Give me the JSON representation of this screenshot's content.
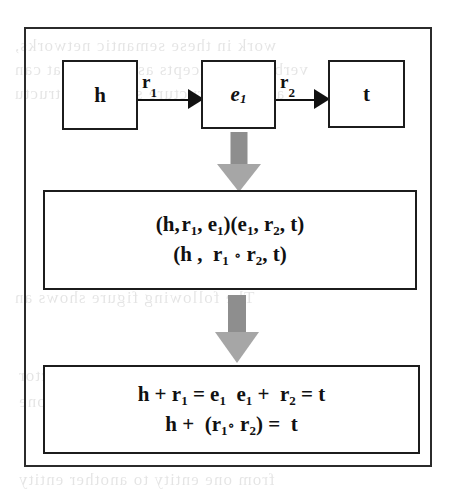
{
  "figure": {
    "name": "relation-path-composition-diagram",
    "frame_border_color": "#2b2b2b",
    "flow_arrow_shaft_color": "#8e8e8e",
    "flow_arrow_head_color": "#a6a6a6",
    "node_border_color": "#1c1c1c",
    "text_color": "#111111"
  },
  "graph": {
    "nodes": [
      {
        "id": "head",
        "label": "h",
        "sub": "",
        "italic": false
      },
      {
        "id": "entity",
        "label": "e",
        "sub": "1",
        "italic": true
      },
      {
        "id": "tail",
        "label": "t",
        "sub": "",
        "italic": false
      }
    ],
    "edges": [
      {
        "id": "edge-r1",
        "label": "r",
        "sub": "1",
        "from": "head",
        "to": "entity"
      },
      {
        "id": "edge-r2",
        "label": "r",
        "sub": "2",
        "from": "entity",
        "to": "tail"
      }
    ]
  },
  "flow_arrows": [
    {
      "id": "flow-arrow-1",
      "direction": "down"
    },
    {
      "id": "flow-arrow-2",
      "direction": "down"
    }
  ],
  "composition_box": {
    "line1_parts": [
      {
        "t": "(h, r"
      },
      {
        "sub": "1"
      },
      {
        "t": ", e"
      },
      {
        "sub": "1"
      },
      {
        "t": ")(e"
      },
      {
        "sub": "1"
      },
      {
        "t": ", r"
      },
      {
        "sub": "2"
      },
      {
        "t": ", t)"
      }
    ],
    "line2_parts": [
      {
        "t": "(h ,  r"
      },
      {
        "sub": "1"
      },
      {
        "ring": " ∘ "
      },
      {
        "t": "r"
      },
      {
        "sub": "2"
      },
      {
        "t": ", t)"
      }
    ],
    "line1_text": "(h, r1, e1)(e1, r2, t)",
    "line2_text": "(h ,  r1 ∘ r2, t)"
  },
  "translation_box": {
    "line1_parts": [
      {
        "t": "h + r"
      },
      {
        "sub": "1"
      },
      {
        "t": " = e"
      },
      {
        "sub": "1"
      },
      {
        "t": "  e"
      },
      {
        "sub": "1"
      },
      {
        "t": " +  r"
      },
      {
        "sub": "2"
      },
      {
        "t": " = t"
      }
    ],
    "line2_parts": [
      {
        "t": "h +  (r"
      },
      {
        "sub": "1"
      },
      {
        "ring": "∘ "
      },
      {
        "t": " r"
      },
      {
        "sub": "2"
      },
      {
        "t": ")  =  t"
      }
    ],
    "line1_text": "h + r1 = e1  e1 +  r2 = t",
    "line2_text": "h +  (r1∘  r2)  =  t"
  },
  "scan_bleed": {
    "lines": [
      {
        "text": "work  in  these  semantic  networks,",
        "left": 14,
        "top": 36
      },
      {
        "text": "verbs and concepts as triples that can",
        "left": 14,
        "top": 60
      },
      {
        "text": "and  sub-structure  semantic  structu",
        "left": 14,
        "top": 84
      },
      {
        "text": "The   following  figure   shows   an",
        "left": 14,
        "top": 288
      },
      {
        "text": "and  figure  3  shows  adding  of  two  vector",
        "left": 18,
        "top": 366
      },
      {
        "text": "two  vectors  together  to  move  one",
        "left": 18,
        "top": 392
      },
      {
        "text": "from  one  entity  to  another  entity",
        "left": 18,
        "top": 470
      }
    ]
  }
}
